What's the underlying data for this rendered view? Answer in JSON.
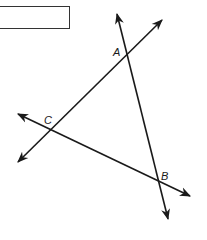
{
  "diagram": {
    "type": "geometry-intersecting-lines",
    "answer_box": {
      "value": ""
    },
    "points": [
      {
        "name": "A",
        "label": "A",
        "x": 125,
        "y": 58
      },
      {
        "name": "B",
        "label": "B",
        "x": 157,
        "y": 180
      },
      {
        "name": "C",
        "label": "C",
        "x": 50,
        "y": 130
      }
    ],
    "lines": [
      {
        "name": "line-AB",
        "through": [
          "A",
          "B"
        ],
        "arrows": "both"
      },
      {
        "name": "line-AC",
        "through": [
          "A",
          "C"
        ],
        "arrows": "both"
      },
      {
        "name": "line-CB",
        "through": [
          "C",
          "B"
        ],
        "arrows": "both"
      }
    ],
    "colors": {
      "stroke": "#1a1a1a",
      "background": "#ffffff"
    }
  }
}
